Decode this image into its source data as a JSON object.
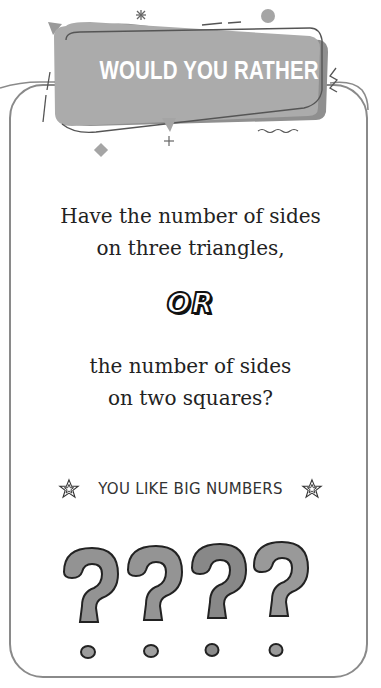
{
  "header": {
    "title": "WOULD YOU RATHER"
  },
  "question": {
    "option_a_line1": "Have the number of sides",
    "option_a_line2": "on three triangles,",
    "separator": "OR",
    "option_b_line1": "the number of sides",
    "option_b_line2": "on two squares?"
  },
  "hint": {
    "text": "YOU LIKE BIG NUMBERS",
    "left_icon": "star-icon",
    "right_icon": "star-icon"
  },
  "decoration": {
    "question_marks_count": 4,
    "icon": "question-mark-icon"
  },
  "colors": {
    "banner_fill": "#a9a9a9",
    "banner_shadow": "#8c8c8c",
    "card_border": "#8a8a8a",
    "text": "#222222",
    "qmark_fill": "#8f8f8f"
  }
}
